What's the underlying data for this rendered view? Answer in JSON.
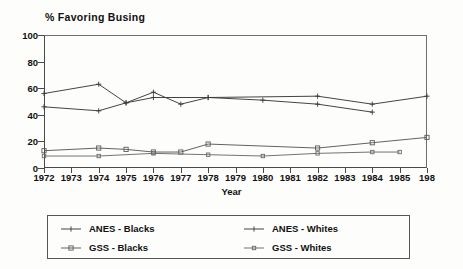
{
  "chart_data": {
    "type": "line",
    "title": "% Favoring Busing",
    "xlabel": "Year",
    "ylabel": "",
    "ylim": [
      0,
      100
    ],
    "yticks": [
      0,
      20,
      40,
      60,
      80,
      100
    ],
    "xlim": [
      1972,
      1986
    ],
    "grid": false,
    "legend_position": "bottom",
    "categories": [
      1972,
      1973,
      1974,
      1975,
      1976,
      1977,
      1978,
      1979,
      1980,
      1981,
      1982,
      1983,
      1984,
      1985,
      1986
    ],
    "xtick_labels": [
      "1972",
      "1973",
      "1974",
      "1975",
      "1976",
      "1977",
      "1978",
      "1979",
      "1980",
      "1981",
      "1982",
      "1983",
      "1984",
      "1985",
      "198"
    ],
    "series": [
      {
        "name": "ANES - Blacks",
        "marker": "plus",
        "color": "#3a3a3a",
        "points": [
          {
            "x": 1972,
            "y": 56
          },
          {
            "x": 1974,
            "y": 63
          },
          {
            "x": 1975,
            "y": 49
          },
          {
            "x": 1976,
            "y": 57
          },
          {
            "x": 1977,
            "y": 48
          },
          {
            "x": 1978,
            "y": 53
          },
          {
            "x": 1982,
            "y": 54
          },
          {
            "x": 1984,
            "y": 48
          },
          {
            "x": 1986,
            "y": 54
          }
        ]
      },
      {
        "name": "ANES - Whites",
        "marker": "plus",
        "color": "#3a3a3a",
        "points": [
          {
            "x": 1972,
            "y": 46
          },
          {
            "x": 1974,
            "y": 43
          },
          {
            "x": 1975,
            "y": 49
          },
          {
            "x": 1976,
            "y": 53
          },
          {
            "x": 1978,
            "y": 53
          },
          {
            "x": 1980,
            "y": 51
          },
          {
            "x": 1982,
            "y": 48
          },
          {
            "x": 1984,
            "y": 42
          }
        ]
      },
      {
        "name": "GSS - Blacks",
        "marker": "square",
        "color": "#5a5a5a",
        "points": [
          {
            "x": 1972,
            "y": 13
          },
          {
            "x": 1974,
            "y": 15
          },
          {
            "x": 1975,
            "y": 14
          },
          {
            "x": 1976,
            "y": 12
          },
          {
            "x": 1977,
            "y": 12
          },
          {
            "x": 1978,
            "y": 18
          },
          {
            "x": 1982,
            "y": 15
          },
          {
            "x": 1984,
            "y": 19
          },
          {
            "x": 1986,
            "y": 23
          }
        ]
      },
      {
        "name": "GSS - Whites",
        "marker": "square-small",
        "color": "#6b6b6b",
        "points": [
          {
            "x": 1972,
            "y": 9
          },
          {
            "x": 1974,
            "y": 9
          },
          {
            "x": 1976,
            "y": 11
          },
          {
            "x": 1978,
            "y": 10
          },
          {
            "x": 1980,
            "y": 9
          },
          {
            "x": 1982,
            "y": 11
          },
          {
            "x": 1984,
            "y": 12
          },
          {
            "x": 1985,
            "y": 12
          }
        ]
      }
    ]
  },
  "legend": {
    "entries": [
      {
        "label": "ANES - Blacks"
      },
      {
        "label": "ANES - Whites"
      },
      {
        "label": "GSS - Blacks"
      },
      {
        "label": "GSS - Whites"
      }
    ]
  }
}
